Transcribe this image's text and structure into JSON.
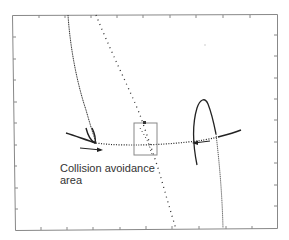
{
  "figure": {
    "annotation_line1": "Collision avoidance",
    "annotation_line2": "area"
  },
  "colors": {
    "axes": "#888888",
    "trajectory": "#222222",
    "box": "#888888",
    "background": "#ffffff"
  },
  "axes": {
    "frame": {
      "left": 12,
      "top": 15,
      "right": 277,
      "bottom": 230
    },
    "x_ticks": 10,
    "y_ticks": 9,
    "tick_labels": "none"
  }
}
